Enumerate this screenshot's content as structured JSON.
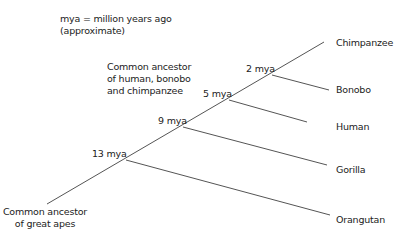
{
  "legend": {
    "line1": "mya = million years ago",
    "line2": "(approximate)"
  },
  "annotation": {
    "line1": "Common ancestor",
    "line2": "of human, bonobo",
    "line3": "and chimpanzee"
  },
  "root_label": {
    "line1": "Common ancestor",
    "line2": "of great apes"
  },
  "nodes": [
    {
      "label": "2 mya"
    },
    {
      "label": "5 mya"
    },
    {
      "label": "9 mya"
    },
    {
      "label": "13 mya"
    }
  ],
  "leaves": [
    {
      "label": "Chimpanzee"
    },
    {
      "label": "Bonobo"
    },
    {
      "label": "Human"
    },
    {
      "label": "Gorilla"
    },
    {
      "label": "Orangutan"
    }
  ],
  "colors": {
    "line": "#555555",
    "text": "#222222"
  }
}
